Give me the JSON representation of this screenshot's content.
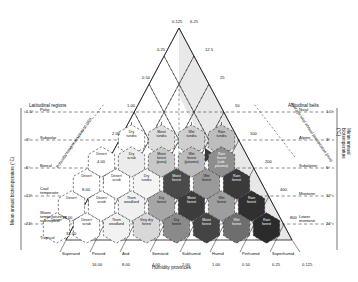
{
  "diagram": {
    "axis_left_title": "Mean annual biotemperature (°C)",
    "axis_right_title": "Mean annual biotemperature (°C)",
    "left_header": "Latitudinal regions",
    "right_header": "Altitudinal belts",
    "diag_left_label": "Potential evapotranspiration ratio",
    "diag_right_label": "Average total annual precipitation (mm)",
    "bottom_header": "Humidity provinces"
  },
  "latitudinal_regions": [
    {
      "name": "Polar",
      "temp": "1.5°"
    },
    {
      "name": "Subpolar",
      "temp": "3°"
    },
    {
      "name": "Boreal",
      "temp": "6°"
    },
    {
      "name": "Cool\ntemperate",
      "temp": "12°"
    },
    {
      "name": "Warm\ntemperature or\nsubtropical",
      "temp": "24°"
    },
    {
      "name": "Tropical",
      "temp": ""
    }
  ],
  "altitudinal_belts": [
    {
      "name": "Nival",
      "temp": "1.5°"
    },
    {
      "name": "Alpine",
      "temp": "3°"
    },
    {
      "name": "Subalpine",
      "temp": "6°"
    },
    {
      "name": "Montane",
      "temp": "12°"
    },
    {
      "name": "Lower\nmontane",
      "temp": "24°"
    }
  ],
  "pet_ticks_top": [
    "0.125",
    "0.25",
    "0.50",
    "1.00",
    "2.00",
    "4.00",
    "8.00",
    "16.00",
    "32.00"
  ],
  "precip_ticks": [
    "6.25",
    "12.5",
    "25",
    "50",
    "100",
    "200",
    "400",
    "800"
  ],
  "humidity_provinces": [
    {
      "name": "Superarid",
      "value": ""
    },
    {
      "name": "Perarid",
      "value": "16.00"
    },
    {
      "name": "Arid",
      "value": "8.00"
    },
    {
      "name": "Semiarid",
      "value": "4.00"
    },
    {
      "name": "Subhumid",
      "value": "2.00"
    },
    {
      "name": "Humid",
      "value": "1.00"
    },
    {
      "name": "Perhumid",
      "value": "0.50"
    },
    {
      "name": "Superhumid",
      "value": "0.25"
    },
    {
      "name": "",
      "value": "0.125"
    }
  ],
  "life_zones": [
    {
      "label": "Dry\ntundra",
      "row": 1,
      "cx": 131.5,
      "cy": 140.0,
      "fill": "#ffffff",
      "text": "#111111"
    },
    {
      "label": "Moist\ntundra",
      "row": 1,
      "cx": 161.5,
      "cy": 140.0,
      "fill": "#dedede",
      "text": "#111111"
    },
    {
      "label": "Wet\ntundra",
      "row": 1,
      "cx": 191.5,
      "cy": 140.0,
      "fill": "#cfcfcf",
      "text": "#111111"
    },
    {
      "label": "Rain\ntundra",
      "row": 1,
      "cx": 221.5,
      "cy": 140.0,
      "fill": "#bdbdbd",
      "text": "#111111"
    },
    {
      "label": "Desert",
      "row": 2,
      "cx": 101.5,
      "cy": 162.0,
      "fill": "#ffffff",
      "text": "#111111"
    },
    {
      "label": "Dry\nscrub",
      "row": 2,
      "cx": 131.5,
      "cy": 162.0,
      "fill": "#ececec",
      "text": "#111111"
    },
    {
      "label": "Moist\nforest\n(puna)",
      "row": 2,
      "cx": 161.5,
      "cy": 162.0,
      "fill": "#c8c8c8",
      "text": "#111111"
    },
    {
      "label": "Wet\nforest\n(páramo)",
      "row": 2,
      "cx": 191.5,
      "cy": 162.0,
      "fill": "#bcbcbc",
      "text": "#111111"
    },
    {
      "label": "Rain\nforest\n(sub-\npáramo)",
      "row": 2,
      "cx": 221.5,
      "cy": 162.0,
      "fill": "#8e8e8e",
      "text": "#ffffff"
    },
    {
      "label": "Desert",
      "row": 3,
      "cx": 86.5,
      "cy": 184.0,
      "fill": "#ffffff",
      "text": "#111111"
    },
    {
      "label": "Desert\nscrub",
      "row": 3,
      "cx": 116.5,
      "cy": 184.0,
      "fill": "#ffffff",
      "text": "#111111"
    },
    {
      "label": "Dry\ntundra",
      "row": 3,
      "cx": 146.5,
      "cy": 184.0,
      "fill": "#f4f4f4",
      "text": "#111111"
    },
    {
      "label": "Moist\nforest",
      "row": 3,
      "cx": 176.5,
      "cy": 184.0,
      "fill": "#4a4a4a",
      "text": "#ffffff"
    },
    {
      "label": "Wet\nforest",
      "row": 3,
      "cx": 206.5,
      "cy": 184.0,
      "fill": "#9a9a9a",
      "text": "#111111"
    },
    {
      "label": "Rain\nforest",
      "row": 3,
      "cx": 236.5,
      "cy": 184.0,
      "fill": "#3a3a3a",
      "text": "#ffffff"
    },
    {
      "label": "Desert",
      "row": 4,
      "cx": 71.5,
      "cy": 206.0,
      "fill": "#ffffff",
      "text": "#111111"
    },
    {
      "label": "Desert\nscrub",
      "row": 4,
      "cx": 101.5,
      "cy": 206.0,
      "fill": "#ffffff",
      "text": "#111111"
    },
    {
      "label": "Thorn\nwoodland",
      "row": 4,
      "cx": 131.5,
      "cy": 206.0,
      "fill": "#f0f0f0",
      "text": "#111111"
    },
    {
      "label": "Dry\nforest",
      "row": 4,
      "cx": 161.5,
      "cy": 206.0,
      "fill": "#a6a6a6",
      "text": "#111111"
    },
    {
      "label": "Moist\nforest",
      "row": 4,
      "cx": 191.5,
      "cy": 206.0,
      "fill": "#3c3c3c",
      "text": "#ffffff"
    },
    {
      "label": "Wet\nforest",
      "row": 4,
      "cx": 221.5,
      "cy": 206.0,
      "fill": "#9e9e9e",
      "text": "#111111"
    },
    {
      "label": "Rain\nforest",
      "row": 4,
      "cx": 251.5,
      "cy": 206.0,
      "fill": "#303030",
      "text": "#ffffff"
    },
    {
      "label": "Desert",
      "row": 5,
      "cx": 56.5,
      "cy": 228.0,
      "fill": "#ffffff",
      "text": "#111111"
    },
    {
      "label": "Desert\nscrub",
      "row": 5,
      "cx": 86.5,
      "cy": 228.0,
      "fill": "#ffffff",
      "text": "#111111"
    },
    {
      "label": "Thorn\nwoodland",
      "row": 5,
      "cx": 116.5,
      "cy": 228.0,
      "fill": "#f2f2f2",
      "text": "#111111"
    },
    {
      "label": "Very dry\nforest",
      "row": 5,
      "cx": 146.5,
      "cy": 228.0,
      "fill": "#d8d8d8",
      "text": "#111111"
    },
    {
      "label": "Dry\nforest",
      "row": 5,
      "cx": 176.5,
      "cy": 228.0,
      "fill": "#8a8a8a",
      "text": "#111111"
    },
    {
      "label": "Moist\nforest",
      "row": 5,
      "cx": 206.5,
      "cy": 228.0,
      "fill": "#444444",
      "text": "#ffffff"
    },
    {
      "label": "Wet\nforest",
      "row": 5,
      "cx": 236.5,
      "cy": 228.0,
      "fill": "#6e6e6e",
      "text": "#ffffff"
    },
    {
      "label": "Rain\nforest",
      "row": 5,
      "cx": 266.5,
      "cy": 228.0,
      "fill": "#2b2b2b",
      "text": "#ffffff"
    }
  ]
}
